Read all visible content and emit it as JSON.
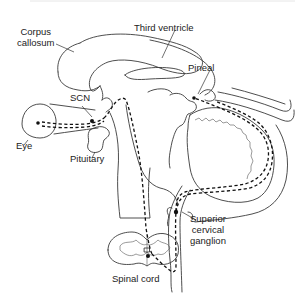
{
  "diagram": {
    "type": "anatomical-line-drawing",
    "labels": {
      "corpus_callosum": [
        "Corpus",
        "callosum"
      ],
      "third_ventricle": "Third ventricle",
      "pineal": "Pineal",
      "scn": "SCN",
      "eye": "Eye",
      "pituitary": "Pituitary",
      "superior_cervical_ganglion": [
        "Superior",
        "cervical",
        "ganglion"
      ],
      "spinal_cord": "Spinal cord"
    },
    "pathway": {
      "style": "dashed",
      "color": "#111111",
      "sequence": [
        "Eye",
        "SCN",
        "Spinal cord",
        "Superior cervical ganglion",
        "Pineal"
      ]
    },
    "colors": {
      "background": "#ffffff",
      "outline": "#3a3a3a",
      "text": "#222222"
    }
  }
}
